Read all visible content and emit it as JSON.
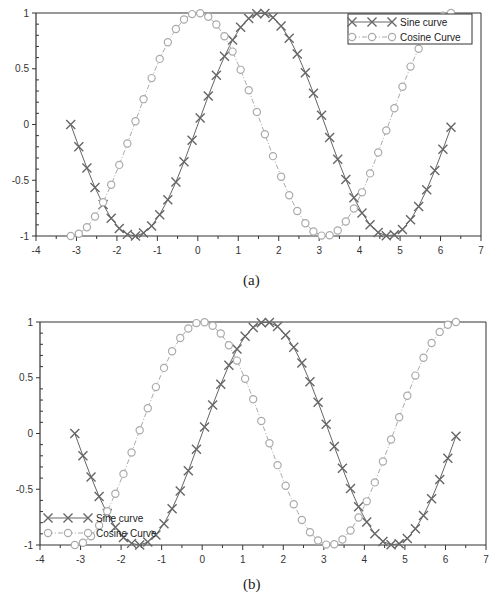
{
  "chart_data": [
    {
      "id": "a",
      "type": "line",
      "caption": "(a)",
      "xlim": [
        -4,
        7
      ],
      "ylim": [
        -1,
        1
      ],
      "xticks": [
        "-4",
        "-3",
        "-2",
        "-1",
        "0",
        "1",
        "2",
        "3",
        "4",
        "5",
        "6",
        "7"
      ],
      "yticks": [
        "-1",
        "-0.5",
        "0",
        "0.5",
        "1"
      ],
      "grid": false,
      "legend_position": "upper right",
      "series": [
        {
          "name": "Sine curve",
          "function": "sin(x)",
          "x_range": [
            -3.1416,
            6.2832
          ],
          "step": 0.2,
          "marker": "x",
          "line": "solid",
          "color": "#666666"
        },
        {
          "name": "Cosine Curve",
          "function": "cos(x)",
          "x_range": [
            -3.1416,
            6.2832
          ],
          "step": 0.2,
          "marker": "o",
          "line": "dash-dot",
          "color": "#aaaaaa"
        }
      ],
      "plot_box": {
        "left": 36,
        "top": 13,
        "right": 481,
        "bottom": 236
      },
      "legend_box": {
        "x": 348,
        "y": 14,
        "w": 124,
        "h": 30
      }
    },
    {
      "id": "b",
      "type": "line",
      "caption": "(b)",
      "xlim": [
        -4,
        7
      ],
      "ylim": [
        -1,
        1
      ],
      "xticks": [
        "-4",
        "-3",
        "-2",
        "-1",
        "0",
        "1",
        "2",
        "3",
        "4",
        "5",
        "6",
        "7"
      ],
      "yticks": [
        "-1",
        "-0.5",
        "0",
        "0.5",
        "1"
      ],
      "grid": false,
      "legend_position": "lower left (overlapping curves)",
      "series": [
        {
          "name": "Sine curve",
          "function": "sin(x)",
          "x_range": [
            -3.1416,
            6.2832
          ],
          "step": 0.2,
          "marker": "x",
          "line": "solid",
          "color": "#666666"
        },
        {
          "name": "Cosine Curve",
          "function": "cos(x)",
          "x_range": [
            -3.1416,
            6.2832
          ],
          "step": 0.2,
          "marker": "o",
          "line": "dash-dot",
          "color": "#aaaaaa"
        }
      ],
      "plot_box": {
        "left": 40,
        "top": 22,
        "right": 486,
        "bottom": 245
      },
      "legend_box": {
        "x": 44,
        "y": 210,
        "w": 130,
        "h": 30
      }
    }
  ]
}
